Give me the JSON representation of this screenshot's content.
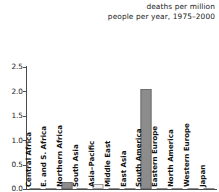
{
  "chart_data": {
    "type": "bar",
    "title": "deaths per million people per year, 1975–2000",
    "title_lines": [
      "deaths per million",
      "people per year, 1975–2000"
    ],
    "xlabel": "",
    "ylabel": "",
    "ylim": [
      0.0,
      2.5
    ],
    "ytick_labels": [
      "2.5",
      "2.0",
      "1.5",
      "1.0",
      "0.5",
      "0.0"
    ],
    "ytick_values": [
      2.5,
      2.0,
      1.5,
      1.0,
      0.5,
      0.0
    ],
    "grid": false,
    "legend": "none",
    "categories": [
      "Central Africa",
      "E. and S. Africa",
      "Northern Africa",
      "South Asia",
      "Asia–Pacific",
      "Middle East",
      "East Asia",
      "South America",
      "Eastern Europe",
      "North America",
      "Western Europe",
      "Japan"
    ],
    "values": [
      0.01,
      0.02,
      0.15,
      0.01,
      0.1,
      0.01,
      0.01,
      2.04,
      0.01,
      0.01,
      0.01,
      0.01
    ],
    "bar_styles": [
      "zero",
      "zero",
      "solid",
      "zero",
      "light",
      "zero",
      "zero",
      "solid",
      "zero",
      "zero",
      "zero",
      "zero"
    ]
  },
  "colors": {
    "bar_fill": "#8c8c8c",
    "bar_edge": "#6e6e6e",
    "bar_light_fill": "#f0f0f0",
    "bar_light_edge": "#9a9a9a",
    "axis": "#4d4d4d",
    "text": "#1a1a1a",
    "background": "#ffffff"
  }
}
